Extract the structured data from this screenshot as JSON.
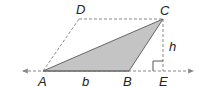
{
  "diagram": {
    "colors": {
      "fill": "#c4c4c4",
      "stroke": "#555555",
      "dashed": "#888888",
      "text": "#222222"
    },
    "points": {
      "A": {
        "label": "A",
        "x": 43,
        "y": 71
      },
      "B": {
        "label": "B",
        "x": 129,
        "y": 71
      },
      "C": {
        "label": "C",
        "x": 163,
        "y": 19
      },
      "D": {
        "label": "D",
        "x": 79,
        "y": 19
      },
      "E": {
        "label": "E",
        "x": 163,
        "y": 71
      }
    },
    "labels": {
      "A": "A",
      "B": "B",
      "C": "C",
      "D": "D",
      "E": "E",
      "base": "b",
      "height": "h"
    }
  }
}
